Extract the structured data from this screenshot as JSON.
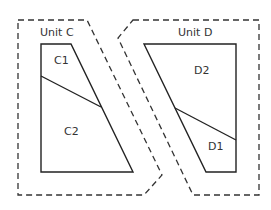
{
  "units": [
    {
      "label": "Unit C",
      "label_pos": [
        40,
        36
      ],
      "outline": "18,20 87,20 162,175 144,195 18,195",
      "block": "41,44 71,44 133,172 41,172",
      "divider": [
        [
          41,
          76
        ],
        [
          101,
          107
        ]
      ],
      "parts": [
        {
          "label": "C1",
          "pos": [
            54,
            64
          ]
        },
        {
          "label": "C2",
          "pos": [
            64,
            135
          ]
        }
      ]
    },
    {
      "label": "Unit D",
      "label_pos": [
        178,
        36
      ],
      "outline": "133,20 259,20 259,195 193,195 118,38",
      "block": "144,44 236,44 236,172 206,172",
      "divider": [
        [
          175,
          108
        ],
        [
          236,
          140
        ]
      ],
      "parts": [
        {
          "label": "D2",
          "pos": [
            194,
            74
          ]
        },
        {
          "label": "D1",
          "pos": [
            208,
            150
          ]
        }
      ]
    }
  ]
}
